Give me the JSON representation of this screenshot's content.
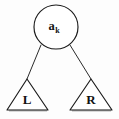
{
  "figure": {
    "caption": "",
    "type": "binary-tree-node-diagram",
    "background_color": "#fdfdfd",
    "stroke_color": "#1a1a1a"
  },
  "root_node": {
    "shape": "circle",
    "label_base": "a",
    "label_subscript": "k",
    "label_full": "a_k",
    "center_x": 56,
    "center_y": 27,
    "radius": 22
  },
  "edges": [
    {
      "name": "left-edge",
      "from_x": 41,
      "from_y": 45,
      "to_x": 27,
      "to_y": 79
    },
    {
      "name": "right-edge",
      "from_x": 70,
      "from_y": 45,
      "to_x": 91,
      "to_y": 79
    }
  ],
  "subtrees": [
    {
      "name": "left-subtree",
      "shape": "triangle",
      "label": "L",
      "apex_x": 27,
      "apex_y": 79,
      "base_left_x": 7,
      "base_right_x": 48,
      "base_y": 110,
      "label_x": 27,
      "label_y": 101
    },
    {
      "name": "right-subtree",
      "shape": "triangle",
      "label": "R",
      "apex_x": 91,
      "apex_y": 79,
      "base_left_x": 70,
      "base_right_x": 112,
      "base_y": 110,
      "label_x": 91,
      "label_y": 101
    }
  ]
}
